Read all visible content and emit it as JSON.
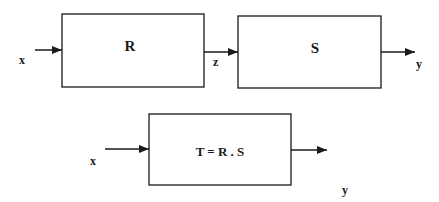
{
  "diagram": {
    "top": {
      "input_label": "x",
      "block_r_label": "R",
      "intermediate_label": "z",
      "block_s_label": "S",
      "output_label": "y"
    },
    "bottom": {
      "input_label": "x",
      "block_t_label": "T = R . S",
      "output_label": "y"
    }
  },
  "colors": {
    "stroke": "#1a1a1a",
    "background": "#ffffff"
  }
}
